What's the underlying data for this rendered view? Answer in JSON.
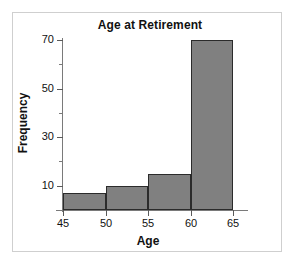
{
  "chart_data": {
    "type": "bar",
    "title": "Age at Retirement",
    "xlabel": "Age",
    "ylabel": "Frequency",
    "subtitle": "",
    "bin_edges": [
      45,
      50,
      55,
      60,
      65
    ],
    "categories": [
      "45-50",
      "50-55",
      "55-60",
      "60-65"
    ],
    "values": [
      7,
      10,
      15,
      70
    ],
    "xlim": [
      45,
      65
    ],
    "ylim": [
      0,
      70
    ],
    "x_ticks": [
      45,
      50,
      55,
      60,
      65
    ],
    "x_tick_labels": [
      "45",
      "50",
      "55",
      "60",
      "65"
    ],
    "y_ticks": [
      10,
      30,
      50,
      70
    ],
    "y_tick_labels": [
      "10",
      "30",
      "50",
      "70"
    ],
    "y_minor_ticks": [
      20,
      40,
      60
    ],
    "grid": false,
    "legend": false,
    "legend_position": "none",
    "bar_fill_color": "#808080",
    "bar_edge_color": "#2b2b2b",
    "axis_color": "#7a7a7a",
    "text_color": "#111111",
    "frame_color": "#cfcfcf",
    "background_color": "#ffffff"
  }
}
